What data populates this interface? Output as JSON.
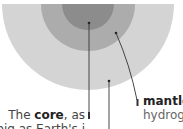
{
  "diagram": {
    "colors": {
      "core": "#8c8c8c",
      "mantle": "#acacac",
      "outer": "#d4d4d4",
      "line": "#333333",
      "background": "#ffffff"
    },
    "layers": [
      {
        "name": "core",
        "cx": 88,
        "cy": 4,
        "r": 26
      },
      {
        "name": "mantle",
        "cx": 88,
        "cy": 4,
        "r": 47
      },
      {
        "name": "outer",
        "cx": 88,
        "cy": 4,
        "r": 86
      }
    ],
    "labels": {
      "core": {
        "prefix": "The ",
        "bold": "core",
        "suffix": ", as",
        "line2": "big as Earth's i"
      },
      "mantle": {
        "bold": "mantle",
        "line2": "hydroge"
      }
    }
  }
}
